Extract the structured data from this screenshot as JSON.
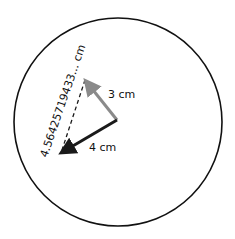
{
  "diagram": {
    "type": "vector-addition-in-circle",
    "vectors": [
      {
        "name": "vector-a",
        "label": "3 cm",
        "color": "#8a8a8a"
      },
      {
        "name": "vector-b",
        "label": "4 cm",
        "color": "#1a1a1a"
      }
    ],
    "resultant": {
      "label": "4.5642571 9433... cm",
      "style": "dashed",
      "color": "#1a1a1a"
    },
    "circle": {
      "stroke": "#111111"
    }
  },
  "labels": {
    "vector_a": "3 cm",
    "vector_b": "4 cm",
    "resultant": "4.56425719433... cm"
  }
}
